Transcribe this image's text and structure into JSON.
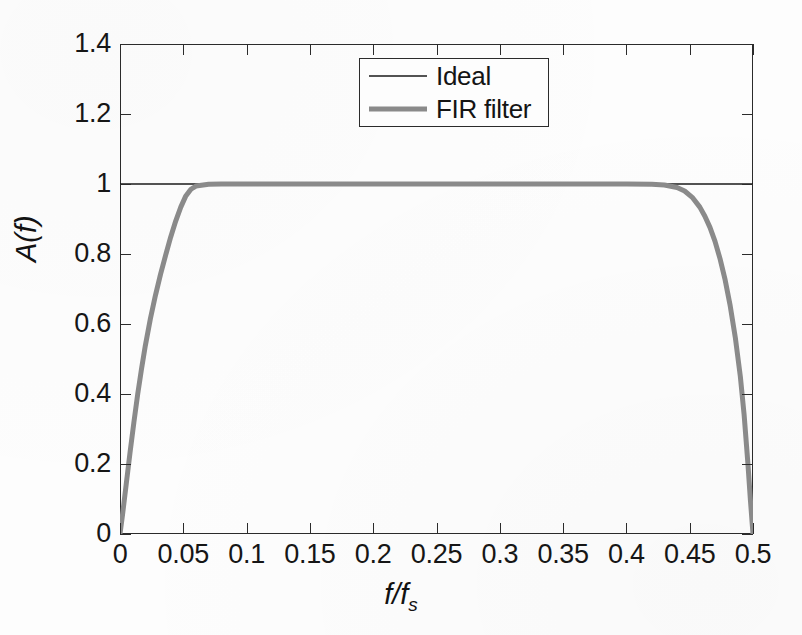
{
  "chart_data": {
    "type": "line",
    "title": "",
    "xlabel": "f/f_s",
    "xlabel_main": "f/f",
    "xlabel_sub": "s",
    "ylabel": "A(f)",
    "xlim": [
      0,
      0.5
    ],
    "ylim": [
      0,
      1.4
    ],
    "grid": false,
    "legend_position": "top-center",
    "xtick_labels": [
      "0",
      "0.05",
      "0.1",
      "0.15",
      "0.2",
      "0.25",
      "0.3",
      "0.35",
      "0.4",
      "0.45",
      "0.5"
    ],
    "xtick_values": [
      0,
      0.05,
      0.1,
      0.15,
      0.2,
      0.25,
      0.3,
      0.35,
      0.4,
      0.45,
      0.5
    ],
    "ytick_labels": [
      "0",
      "0.2",
      "0.4",
      "0.6",
      "0.8",
      "1",
      "1.2",
      "1.4"
    ],
    "ytick_values": [
      0,
      0.2,
      0.4,
      0.6,
      0.8,
      1.0,
      1.2,
      1.4
    ],
    "series": [
      {
        "name": "Ideal",
        "color": "#1a1a1a",
        "line_width": 1.4,
        "style": "thin-black",
        "x": [
          0.0,
          0.5
        ],
        "values": [
          1.0,
          1.0
        ]
      },
      {
        "name": "FIR filter",
        "color": "#8a8a8a",
        "line_width": 5.0,
        "style": "thick-gray",
        "x": [
          0.0,
          0.002,
          0.005,
          0.008,
          0.011,
          0.014,
          0.017,
          0.02,
          0.024,
          0.028,
          0.032,
          0.036,
          0.04,
          0.044,
          0.048,
          0.052,
          0.056,
          0.06,
          0.07,
          0.08,
          0.1,
          0.15,
          0.2,
          0.25,
          0.3,
          0.35,
          0.4,
          0.42,
          0.43,
          0.44,
          0.446,
          0.452,
          0.458,
          0.462,
          0.466,
          0.47,
          0.474,
          0.478,
          0.482,
          0.486,
          0.49,
          0.493,
          0.496,
          0.498,
          0.5
        ],
        "values": [
          0.0,
          0.055,
          0.145,
          0.235,
          0.32,
          0.4,
          0.472,
          0.538,
          0.615,
          0.682,
          0.742,
          0.796,
          0.848,
          0.894,
          0.934,
          0.966,
          0.985,
          0.994,
          0.999,
          1.0,
          1.0,
          1.0,
          1.0,
          1.0,
          1.0,
          1.0,
          1.0,
          0.999,
          0.997,
          0.99,
          0.98,
          0.962,
          0.934,
          0.908,
          0.876,
          0.836,
          0.786,
          0.726,
          0.652,
          0.562,
          0.45,
          0.34,
          0.2,
          0.095,
          0.0
        ]
      }
    ]
  },
  "legend": {
    "entries": [
      {
        "label": "Ideal"
      },
      {
        "label": "FIR filter"
      }
    ]
  },
  "colors": {
    "axis": "#2b2b2b",
    "text": "#141414",
    "ideal_line": "#1a1a1a",
    "fir_line": "#8a8a8a",
    "background": "#fdfdfd"
  }
}
